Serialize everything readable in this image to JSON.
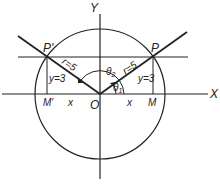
{
  "diagram": {
    "type": "unit-circle-angle-diagram",
    "axes": {
      "x_label": "X",
      "y_label": "Y",
      "origin_label": "O"
    },
    "points": {
      "P": {
        "label": "P",
        "x": 4,
        "y": 3
      },
      "P_prime": {
        "label": "P'",
        "x": -4,
        "y": 3
      }
    },
    "feet": {
      "M": "M",
      "M_prime": "M'"
    },
    "radius_label_P": "r=5",
    "radius_label_P_prime": "r=5",
    "y_label_P": "y=3",
    "y_label_P_prime": "y=3",
    "x_label_right": "x",
    "x_label_left": "x",
    "angle_1": "θ",
    "angle_1_sub": "1",
    "angle_2": "θ",
    "angle_2_sub": "2"
  }
}
